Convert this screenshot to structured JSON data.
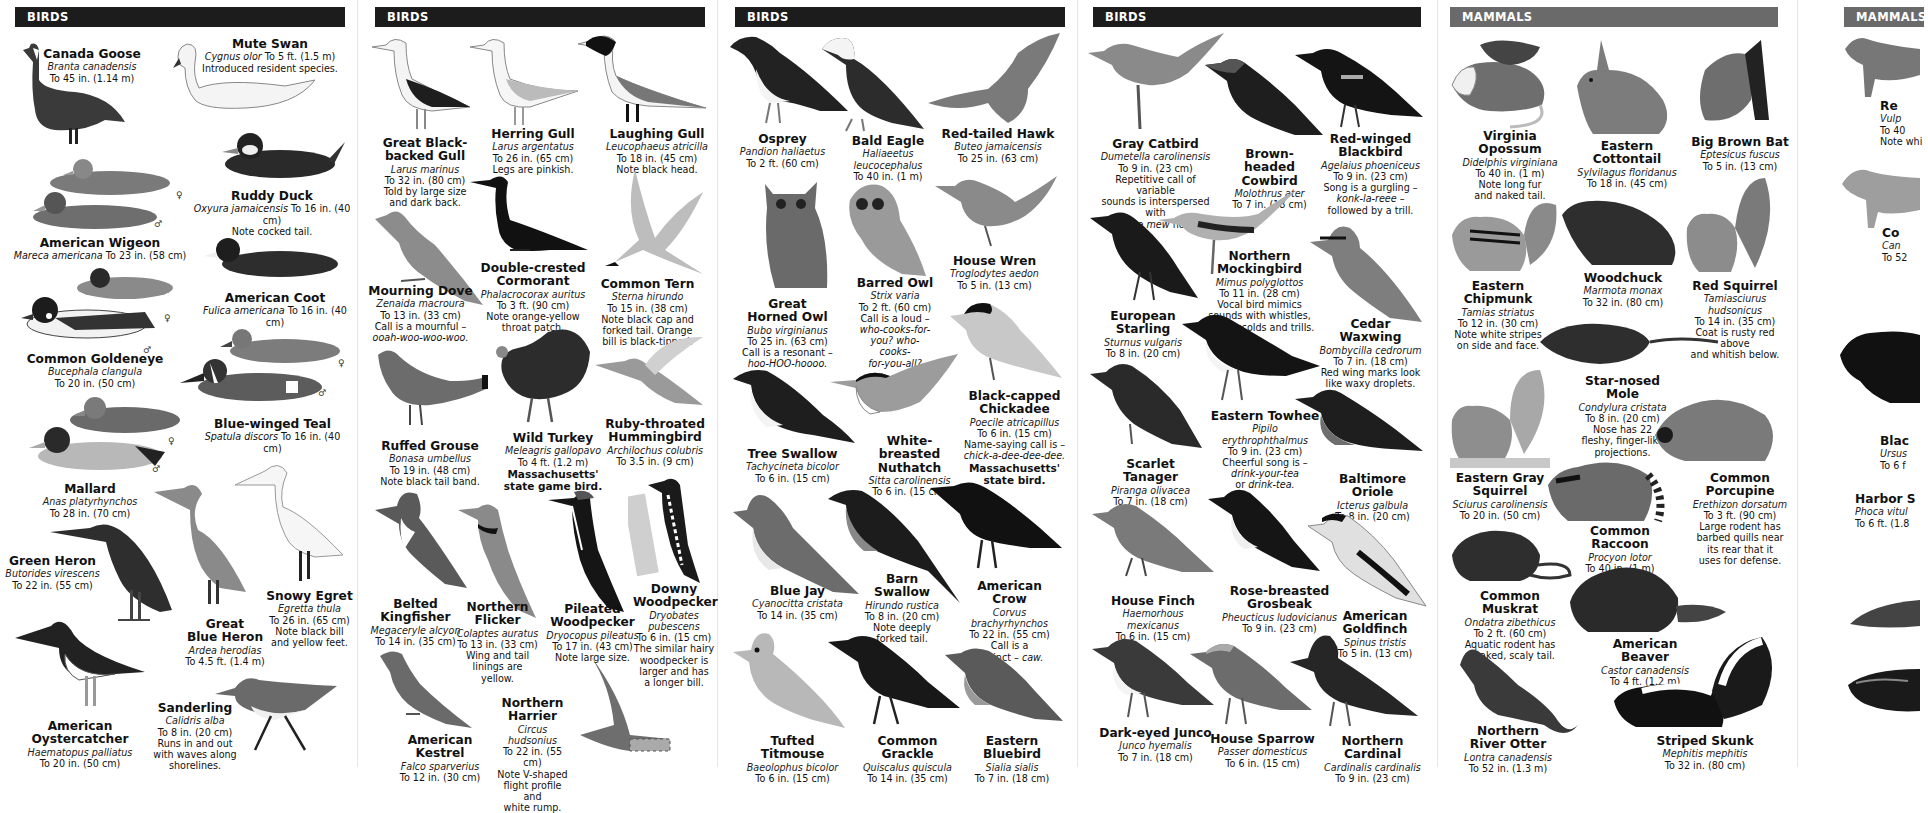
{
  "panels": [
    {
      "header": "BIRDS",
      "kind": "birds"
    },
    {
      "header": "BIRDS",
      "kind": "birds"
    },
    {
      "header": "BIRDS",
      "kind": "birds"
    },
    {
      "header": "BIRDS",
      "kind": "birds"
    },
    {
      "header": "MAMMALS",
      "kind": "mammals"
    },
    {
      "header": "MAMMALS",
      "kind": "mammals"
    }
  ],
  "colors": {
    "birds_header": "#1c1c1c",
    "mammals_header": "#6a6a6a",
    "background": "#ffffff"
  },
  "sex_symbols": {
    "female": "♀",
    "male": "♂"
  },
  "p1": {
    "canada_goose": {
      "name": "Canada Goose",
      "sci": "Branta canadensis",
      "size": "To 45 in. (1.14 m)"
    },
    "mute_swan": {
      "name": "Mute Swan",
      "sci": "Cygnus olor",
      "size": "To 5 ft. (1.5 m)",
      "note": "Introduced resident species."
    },
    "ruddy_duck": {
      "name": "Ruddy Duck",
      "sci": "Oxyura jamaicensis",
      "size": "To 16 in. (40 cm)",
      "note": "Note cocked tail."
    },
    "american_wigeon": {
      "name": "American Wigeon",
      "sci": "Mareca americana",
      "size": "To 23 in. (58 cm)"
    },
    "american_coot": {
      "name": "American Coot",
      "sci": "Fulica americana",
      "size": "To 16 in. (40 cm)"
    },
    "common_goldeneye": {
      "name": "Common Goldeneye",
      "sci": "Bucephala clangula",
      "size": "To 20 in. (50 cm)"
    },
    "blue_winged_teal": {
      "name": "Blue-winged Teal",
      "sci": "Spatula discors",
      "size": "To 16 in. (40 cm)"
    },
    "mallard": {
      "name": "Mallard",
      "sci": "Anas platyrhynchos",
      "size": "To 28 in. (70 cm)"
    },
    "green_heron": {
      "name": "Green Heron",
      "sci": "Butorides virescens",
      "size": "To 22 in. (55 cm)"
    },
    "great_blue_heron": {
      "name1": "Great",
      "name2": "Blue Heron",
      "sci": "Ardea herodias",
      "size": "To 4.5 ft. (1.4 m)"
    },
    "snowy_egret": {
      "name": "Snowy Egret",
      "sci": "Egretta thula",
      "size": "To 26 in. (65 cm)",
      "note1": "Note black bill",
      "note2": "and yellow feet."
    },
    "american_oystercatcher": {
      "name1": "American",
      "name2": "Oystercatcher",
      "sci": "Haematopus palliatus",
      "size": "To 20 in. (50 cm)"
    },
    "sanderling": {
      "name": "Sanderling",
      "sci": "Calidris alba",
      "size": "To 8 in. (20 cm)",
      "note1": "Runs in and out",
      "note2": "with waves along",
      "note3": "shorelines."
    }
  },
  "p2": {
    "great_black_backed_gull": {
      "name1": "Great Black-",
      "name2": "backed Gull",
      "sci": "Larus marinus",
      "size": "To 32 in. (80 cm)",
      "note1": "Told by large size",
      "note2": "and dark back."
    },
    "herring_gull": {
      "name": "Herring Gull",
      "sci": "Larus argentatus",
      "size": "To 26 in. (65 cm)",
      "note": "Legs are pinkish."
    },
    "laughing_gull": {
      "name": "Laughing Gull",
      "sci": "Leucophaeus atricilla",
      "size": "To 18 in. (45 cm)",
      "note": "Note black head."
    },
    "mourning_dove": {
      "name": "Mourning Dove",
      "sci": "Zenaida macroura",
      "size": "To 13 in. (33 cm)",
      "note1": "Call is a mournful –",
      "call": "ooah-woo-woo-woo."
    },
    "double_crested_cormorant": {
      "name1": "Double-crested",
      "name2": "Cormorant",
      "sci": "Phalacrocorax auritus",
      "size": "To 3 ft. (90 cm)",
      "note1": "Note orange-yellow",
      "note2": "throat patch."
    },
    "common_tern": {
      "name": "Common Tern",
      "sci": "Sterna hirundo",
      "size": "To 15 in. (38 cm)",
      "note1": "Note black cap and",
      "note2": "forked tail. Orange",
      "note3": "bill is black-tipped."
    },
    "ruffed_grouse": {
      "name": "Ruffed Grouse",
      "sci": "Bonasa umbellus",
      "size": "To 19 in. (48 cm)",
      "note": "Note black tail band."
    },
    "wild_turkey": {
      "name": "Wild Turkey",
      "sci": "Meleagris gallopavo",
      "size": "To 4 ft. (1.2 m)",
      "bold1": "Massachusetts'",
      "bold2": "state game bird."
    },
    "ruby_throated_hummingbird": {
      "name1": "Ruby-throated",
      "name2": "Hummingbird",
      "sci": "Archilochus colubris",
      "size": "To 3.5 in. (9 cm)"
    },
    "belted_kingfisher": {
      "name1": "Belted",
      "name2": "Kingfisher",
      "sci": "Megaceryle alcyon",
      "size": "To 14 in. (35 cm)"
    },
    "northern_flicker": {
      "name1": "Northern",
      "name2": "Flicker",
      "sci": "Colaptes auratus",
      "size": "To 13 in. (33 cm)",
      "note1": "Wing and tail",
      "note2": "linings are",
      "note3": "yellow."
    },
    "pileated_woodpecker": {
      "name1": "Pileated",
      "name2": "Woodpecker",
      "sci": "Dryocopus pileatus",
      "size": "To 17 in. (43 cm)",
      "note": "Note large size."
    },
    "downy_woodpecker": {
      "name1": "Downy",
      "name2": "Woodpecker",
      "sci1": "Dryobates",
      "sci2": "pubescens",
      "size": "To 6 in. (15 cm)",
      "note1": "The similar hairy",
      "note2": "woodpecker is",
      "note3": "larger and has",
      "note4": "a longer bill."
    },
    "american_kestrel": {
      "name": "American Kestrel",
      "sci": "Falco sparverius",
      "size": "To 12 in. (30 cm)"
    },
    "northern_harrier": {
      "name1": "Northern",
      "name2": "Harrier",
      "sci": "Circus hudsonius",
      "size": "To 22 in. (55 cm)",
      "note1": "Note V-shaped",
      "note2": "flight profile and",
      "note3": "white rump."
    }
  },
  "p3": {
    "osprey": {
      "name": "Osprey",
      "sci": "Pandion haliaetus",
      "size": "To 2 ft. (60 cm)"
    },
    "bald_eagle": {
      "name": "Bald Eagle",
      "sci1": "Haliaeetus",
      "sci2": "leucocephalus",
      "size": "To 40 in. (1 m)"
    },
    "red_tailed_hawk": {
      "name": "Red-tailed Hawk",
      "sci": "Buteo jamaicensis",
      "size": "To 25 in. (63 cm)"
    },
    "great_horned_owl": {
      "name1": "Great",
      "name2": "Horned Owl",
      "sci": "Bubo virginianus",
      "size": "To 25 in. (63 cm)",
      "note1": "Call is a resonant –",
      "call": "hoo-HOO-hoooo."
    },
    "barred_owl": {
      "name": "Barred Owl",
      "sci": "Strix varia",
      "size": "To 2 ft. (60 cm)",
      "note1": "Call is a loud –",
      "call1": "who-cooks-for-",
      "call2": "you? who-cooks-",
      "call3": "for-you-all?"
    },
    "house_wren": {
      "name": "House Wren",
      "sci": "Troglodytes aedon",
      "size": "To 5 in. (13 cm)"
    },
    "tree_swallow": {
      "name": "Tree Swallow",
      "sci": "Tachycineta bicolor",
      "size": "To 6 in. (15 cm)"
    },
    "white_breasted_nuthatch": {
      "name1": "White-breasted",
      "name2": "Nuthatch",
      "sci": "Sitta carolinensis",
      "size": "To 6 in. (15 cm)"
    },
    "black_capped_chickadee": {
      "name1": "Black-capped",
      "name2": "Chickadee",
      "sci": "Poecile atricapillus",
      "size": "To 6 in. (15 cm)",
      "note1": "Name-saying call is –",
      "call": "chick-a-dee-dee-dee.",
      "bold1": "Massachusetts'",
      "bold2": "state bird."
    },
    "blue_jay": {
      "name": "Blue Jay",
      "sci": "Cyanocitta cristata",
      "size": "To 14 in. (35 cm)"
    },
    "barn_swallow": {
      "name1": "Barn",
      "name2": "Swallow",
      "sci": "Hirundo rustica",
      "size": "To 8 in. (20 cm)",
      "note1": "Note deeply",
      "note2": "forked tail."
    },
    "american_crow": {
      "name": "American Crow",
      "sci1": "Corvus",
      "sci2": "brachyrhynchos",
      "size": "To 22 in. (55 cm)",
      "note1": "Call is a",
      "note2": "distinct –",
      "call": "caw."
    },
    "tufted_titmouse": {
      "name": "Tufted Titmouse",
      "sci": "Baeolophus bicolor",
      "size": "To 6 in. (15 cm)"
    },
    "common_grackle": {
      "name": "Common Grackle",
      "sci": "Quiscalus quiscula",
      "size": "To 14 in. (35 cm)"
    },
    "eastern_bluebird": {
      "name": "Eastern Bluebird",
      "sci": "Sialia sialis",
      "size": "To 7 in. (18 cm)"
    }
  },
  "p4": {
    "gray_catbird": {
      "name": "Gray Catbird",
      "sci": "Dumetella carolinensis",
      "size": "To 9 in. (23 cm)",
      "note1": "Repetitive call of variable",
      "note2": "sounds is interspersed with",
      "note3a": "cat-like",
      "note3b": "mew",
      "note3c": "notes."
    },
    "brown_headed_cowbird": {
      "name1": "Brown-headed",
      "name2": "Cowbird",
      "sci": "Molothrus ater",
      "size": "To 7 in. (18 cm)"
    },
    "red_winged_blackbird": {
      "name1": "Red-winged",
      "name2": "Blackbird",
      "sci": "Agelaius phoeniceus",
      "size": "To 9 in. (23 cm)",
      "note1": "Song is a gurgling –",
      "call": "konk-la-reee –",
      "note2": "followed by a trill."
    },
    "european_starling": {
      "name1": "European",
      "name2": "Starling",
      "sci": "Sturnus vulgaris",
      "size": "To 8 in. (20 cm)"
    },
    "northern_mockingbird": {
      "name1": "Northern",
      "name2": "Mockingbird",
      "sci": "Mimus polyglottos",
      "size": "To 11 in. (28 cm)",
      "note1": "Vocal bird mimics",
      "note2": "sounds with whistles,",
      "note3": "rasps, scolds and trills."
    },
    "cedar_waxwing": {
      "name1": "Cedar",
      "name2": "Waxwing",
      "sci": "Bombycilla cedrorum",
      "size": "To 7 in. (18 cm)",
      "note1": "Red wing marks look",
      "note2": "like waxy droplets."
    },
    "scarlet_tanager": {
      "name": "Scarlet Tanager",
      "sci": "Piranga olivacea",
      "size": "To 7 in. (18 cm)"
    },
    "eastern_towhee": {
      "name": "Eastern Towhee",
      "sci": "Pipilo erythrophthalmus",
      "size": "To 9 in. (23 cm)",
      "note1": "Cheerful song is –",
      "call1": "drink-your-tea",
      "note2a": "or",
      "call2": "drink-tea."
    },
    "baltimore_oriole": {
      "name": "Baltimore Oriole",
      "sci": "Icterus galbula",
      "size": "To 8 in. (20 cm)"
    },
    "house_finch": {
      "name": "House Finch",
      "sci": "Haemorhous mexicanus",
      "size": "To 6 in. (15 cm)"
    },
    "rose_breasted_grosbeak": {
      "name1": "Rose-breasted",
      "name2": "Grosbeak",
      "sci": "Pheucticus ludovicianus",
      "size": "To 9 in. (23 cm)"
    },
    "american_goldfinch": {
      "name1": "American",
      "name2": "Goldfinch",
      "sci": "Spinus tristis",
      "size": "To 5 in. (13 cm)"
    },
    "dark_eyed_junco": {
      "name": "Dark-eyed Junco",
      "sci": "Junco hyemalis",
      "size": "To 7 in. (18 cm)"
    },
    "house_sparrow": {
      "name": "House Sparrow",
      "sci": "Passer domesticus",
      "size": "To 6 in. (15 cm)"
    },
    "northern_cardinal": {
      "name": "Northern Cardinal",
      "sci": "Cardinalis cardinalis",
      "size": "To 9 in. (23 cm)"
    }
  },
  "p5": {
    "virginia_opossum": {
      "name": "Virginia Opossum",
      "sci": "Didelphis virginiana",
      "size": "To 40 in. (1 m)",
      "note1": "Note long fur",
      "note2": "and naked tail."
    },
    "eastern_cottontail": {
      "name1": "Eastern",
      "name2": "Cottontail",
      "sci": "Sylvilagus floridanus",
      "size": "To 18 in. (45 cm)"
    },
    "big_brown_bat": {
      "name": "Big Brown Bat",
      "sci": "Eptesicus fuscus",
      "size": "To 5 in. (13 cm)"
    },
    "eastern_chipmunk": {
      "name1": "Eastern",
      "name2": "Chipmunk",
      "sci": "Tamias striatus",
      "size": "To 12 in. (30 cm)",
      "note1": "Note white stripes",
      "note2": "on side and face."
    },
    "woodchuck": {
      "name": "Woodchuck",
      "sci": "Marmota monax",
      "size": "To 32 in. (80 cm)"
    },
    "red_squirrel": {
      "name": "Red Squirrel",
      "sci": "Tamiasciurus hudsonicus",
      "size": "To 14 in. (35 cm)",
      "note1": "Coat is rusty red above",
      "note2": "and whitish below."
    },
    "star_nosed_mole": {
      "name": "Star-nosed Mole",
      "sci": "Condylura cristata",
      "size": "To 8 in. (20 cm)",
      "note1": "Nose has 22",
      "note2": "fleshy, finger-like",
      "note3": "projections."
    },
    "eastern_gray_squirrel": {
      "name1": "Eastern Gray",
      "name2": "Squirrel",
      "sci": "Sciurus carolinensis",
      "size": "To 20 in. (50 cm)"
    },
    "common_porcupine": {
      "name1": "Common",
      "name2": "Porcupine",
      "sci": "Erethizon dorsatum",
      "size": "To 3 ft. (90 cm)",
      "note1": "Large rodent has",
      "note2": "barbed quills near",
      "note3": "its rear that it",
      "note4": "uses for defense."
    },
    "common_raccoon": {
      "name": "Common Raccoon",
      "sci": "Procyon lotor",
      "size": "To 40 in. (1 m)"
    },
    "common_muskrat": {
      "name": "Common Muskrat",
      "sci": "Ondatra zibethicus",
      "size": "To 2 ft. (60 cm)",
      "note1": "Aquatic rodent has",
      "note2": "a naked, scaly tail."
    },
    "american_beaver": {
      "name": "American Beaver",
      "sci": "Castor canadensis",
      "size": "To 4 ft. (1.2 m)"
    },
    "northern_river_otter": {
      "name1": "Northern",
      "name2": "River Otter",
      "sci": "Lontra canadensis",
      "size": "To 52 in. (1.3 m)"
    },
    "striped_skunk": {
      "name": "Striped Skunk",
      "sci": "Mephitis mephitis",
      "size": "To 32 in. (80 cm)"
    }
  },
  "p6": {
    "red_fox": {
      "name": "Re",
      "sci": "Vulp",
      "size": "To 40",
      "note": "Note whi"
    },
    "coyote": {
      "name": "Co",
      "sci": "Can",
      "size": "To 52"
    },
    "black_bear": {
      "name": "Blac",
      "sci": "Ursus",
      "size": "To 6 f"
    },
    "harbor_seal": {
      "name": "Harbor S",
      "sci": "Phoca vitul",
      "size": "To 6 ft. (1.8"
    }
  }
}
